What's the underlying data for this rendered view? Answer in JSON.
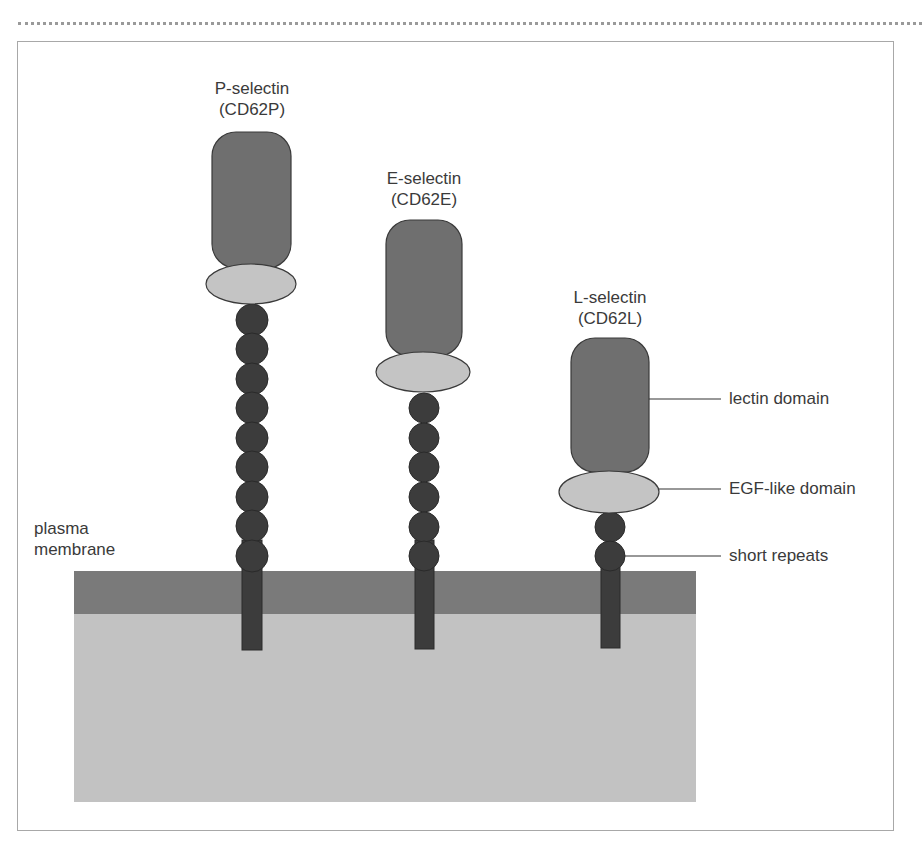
{
  "figure": {
    "colors": {
      "lectin": "#6f6f6f",
      "egf": "#c4c4c4",
      "repeats": "#3c3c3c",
      "membrane_outer": "#7a7a7a",
      "cytoplasm": "#c2c2c2",
      "outline": "#3a3a3a"
    },
    "membrane_label": [
      "plasma",
      "membrane"
    ],
    "selectins": [
      {
        "name": "P-selectin",
        "cd": "(CD62P)",
        "short_repeats": 9
      },
      {
        "name": "E-selectin",
        "cd": "(CD62E)",
        "short_repeats": 6
      },
      {
        "name": "L-selectin",
        "cd": "(CD62L)",
        "short_repeats": 2
      }
    ],
    "legend": [
      {
        "label": "lectin domain"
      },
      {
        "label": "EGF-like domain"
      },
      {
        "label": "short repeats"
      }
    ]
  }
}
